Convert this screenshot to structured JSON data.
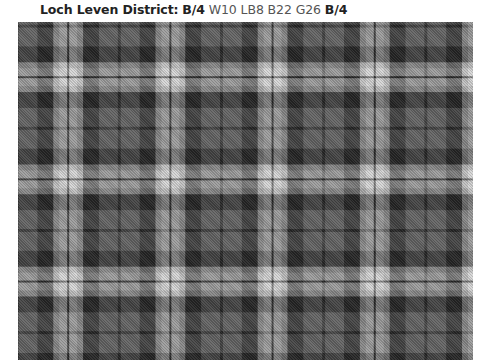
{
  "header": {
    "name": "Loch Leven District:",
    "pivot_start": "B/4",
    "sett_middle": "W10 LB8 B22 G26",
    "pivot_end": "B/4"
  },
  "tartan": {
    "name": "Loch Leven District",
    "threadcount": [
      {
        "color": "B",
        "count": 4,
        "pivot": true
      },
      {
        "color": "W",
        "count": 10
      },
      {
        "color": "LB",
        "count": 8
      },
      {
        "color": "B",
        "count": 22
      },
      {
        "color": "G",
        "count": 26
      },
      {
        "color": "B",
        "count": 4,
        "pivot": true
      }
    ],
    "colors": {
      "B": "#262626",
      "W": "#d6d6d6",
      "LB": "#acacac",
      "G": "#646464"
    },
    "px_per_thread": 0.73,
    "origin_x": -52,
    "origin_y": -47
  }
}
